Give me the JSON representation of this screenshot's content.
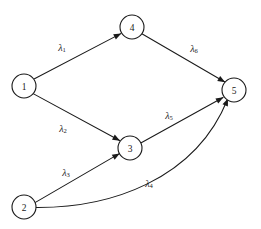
{
  "diagram": {
    "type": "directed-graph",
    "background_color": "#ffffff",
    "stroke_color": "#1a1a1a",
    "nodes": [
      {
        "id": "1",
        "label": "1",
        "cx": 24,
        "cy": 86,
        "r": 12
      },
      {
        "id": "2",
        "label": "2",
        "cx": 24,
        "cy": 207,
        "r": 12
      },
      {
        "id": "3",
        "label": "3",
        "cx": 130,
        "cy": 148,
        "r": 12
      },
      {
        "id": "4",
        "label": "4",
        "cx": 132,
        "cy": 27,
        "r": 12
      },
      {
        "id": "5",
        "label": "5",
        "cx": 234,
        "cy": 90,
        "r": 12
      }
    ],
    "edges": [
      {
        "id": "e1",
        "from": "1",
        "to": "4",
        "label_base": "λ",
        "label_sub": "1",
        "label_x": 62,
        "label_y": 47,
        "path": "M 34.5 78.8 L 120.8 33.6",
        "arrow": {
          "x": 121.2,
          "y": 33.4,
          "angle": -27.6
        },
        "curved": false
      },
      {
        "id": "e2",
        "from": "1",
        "to": "3",
        "label_base": "λ",
        "label_sub": "2",
        "label_x": 63,
        "label_y": 128,
        "path": "M 33.6 93.9 L 119.6 140.5",
        "arrow": {
          "x": 120.0,
          "y": 140.7,
          "angle": 28.5
        },
        "curved": false
      },
      {
        "id": "e3",
        "from": "2",
        "to": "3",
        "label_base": "λ",
        "label_sub": "3",
        "label_x": 66,
        "label_y": 172,
        "path": "M 35.0 202.6 L 119.3 153.6",
        "arrow": {
          "x": 119.7,
          "y": 153.4,
          "angle": -30.2
        },
        "curved": false
      },
      {
        "id": "e4",
        "from": "2",
        "to": "5",
        "label_base": "λ",
        "label_sub": "4",
        "label_x": 149,
        "label_y": 183,
        "path": "M 36.0 207.5 C 110 208 195 180 227.5 99.5",
        "arrow": {
          "x": 228.0,
          "y": 98.5,
          "angle": -68.0
        },
        "curved": true
      },
      {
        "id": "e5",
        "from": "3",
        "to": "5",
        "label_base": "λ",
        "label_sub": "5",
        "label_x": 169,
        "label_y": 115,
        "path": "M 140.8 143.0 L 223.0 97.5",
        "arrow": {
          "x": 223.4,
          "y": 97.3,
          "angle": -29.0
        },
        "curved": false
      },
      {
        "id": "e6",
        "from": "4",
        "to": "5",
        "label_base": "λ",
        "label_sub": "6",
        "label_x": 194,
        "label_y": 48,
        "path": "M 142.3 34.0 L 224.8 82.0",
        "arrow": {
          "x": 225.2,
          "y": 82.3,
          "angle": 30.2
        },
        "curved": false
      }
    ]
  }
}
